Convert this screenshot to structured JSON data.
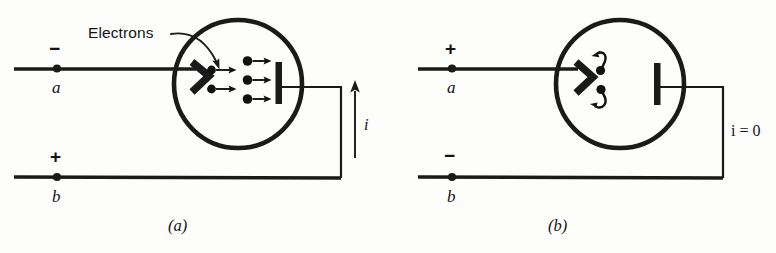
{
  "figure": {
    "kind": "physics-circuit-diagram",
    "background_color": "#fdfdfc",
    "ink_color": "#1a1a1a",
    "width": 776,
    "height": 253
  },
  "panels": [
    {
      "id": "a",
      "caption": "(a)",
      "top_terminal": {
        "sign": "−",
        "node_label": "a"
      },
      "bottom_terminal": {
        "sign": "+",
        "node_label": "b"
      },
      "annotation": {
        "text": "Electrons",
        "points_to": "electron-stream"
      },
      "current": {
        "label": "i",
        "direction": "up",
        "magnitude_text": "i"
      },
      "conducting": true,
      "electron_count_near_cathode": 2,
      "electron_count_near_anode": 3,
      "electron_motion": "cathode-to-anode",
      "electrode_names": {
        "cathode": "cathode-chevron",
        "anode": "anode-plate"
      }
    },
    {
      "id": "b",
      "caption": "(b)",
      "top_terminal": {
        "sign": "+",
        "node_label": "a"
      },
      "bottom_terminal": {
        "sign": "−",
        "node_label": "b"
      },
      "annotation": null,
      "current": {
        "label": "i = 0",
        "direction": "none",
        "magnitude_text": "i = 0"
      },
      "conducting": false,
      "electron_count_near_cathode": 2,
      "electron_count_near_anode": 0,
      "electron_motion": "repelled-back-to-cathode",
      "electrode_names": {
        "cathode": "cathode-chevron",
        "anode": "anode-plate"
      }
    }
  ],
  "current_symbols": {
    "panel_a": "i",
    "panel_b": "i = 0"
  },
  "signs": {
    "minus": "−",
    "plus": "+"
  }
}
